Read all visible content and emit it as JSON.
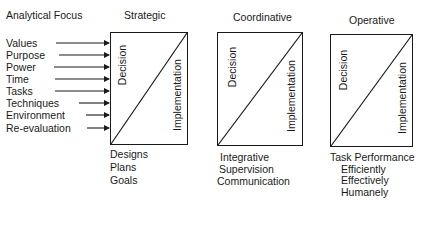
{
  "header": {
    "analytical_focus": "Analytical Focus"
  },
  "focus_items": [
    "Values",
    "Purpose",
    "Power",
    "Time",
    "Tasks",
    "Techniques",
    "Environment",
    "Re-evaluation"
  ],
  "levels": [
    {
      "title": "Strategic",
      "decision_label": "Decision",
      "implementation_label": "Implementation",
      "outputs": [
        "Designs",
        "Plans",
        "Goals"
      ]
    },
    {
      "title": "Coordinative",
      "decision_label": "Decision",
      "implementation_label": "Implementation",
      "outputs": [
        "Integrative",
        "Supervision",
        "Communication"
      ]
    },
    {
      "title": "Operative",
      "decision_label": "Decision",
      "implementation_label": "Implementation",
      "outputs": [
        "Task Performance",
        "Efficiently",
        "Effectively",
        "Humanely"
      ]
    }
  ]
}
